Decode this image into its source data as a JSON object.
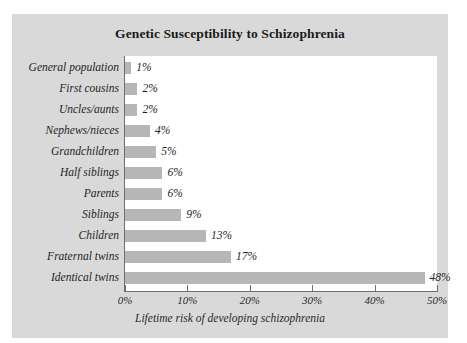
{
  "chart_data": {
    "type": "bar",
    "orientation": "horizontal",
    "title": "Genetic Susceptibility to Schizophrenia",
    "xlabel": "Lifetime risk of developing schizophrenia",
    "ylabel": "",
    "xlim": [
      0,
      50
    ],
    "grid": false,
    "legend": "none",
    "xticks": [
      "0%",
      "10%",
      "20%",
      "30%",
      "40%",
      "50%"
    ],
    "xtick_values": [
      0,
      10,
      20,
      30,
      40,
      50
    ],
    "categories": [
      "General population",
      "First cousins",
      "Uncles/aunts",
      "Nephews/nieces",
      "Grandchildren",
      "Half siblings",
      "Parents",
      "Siblings",
      "Children",
      "Fraternal twins",
      "Identical twins"
    ],
    "values": [
      1,
      2,
      2,
      4,
      5,
      6,
      6,
      9,
      13,
      17,
      48
    ],
    "value_labels": [
      "1%",
      "2%",
      "2%",
      "4%",
      "5%",
      "6%",
      "6%",
      "9%",
      "13%",
      "17%",
      "48%"
    ],
    "bar_color": "#b6b6b6",
    "panel_color": "#d9d9d9",
    "plot_color": "#ffffff",
    "axis_color": "#6e6e6e"
  }
}
